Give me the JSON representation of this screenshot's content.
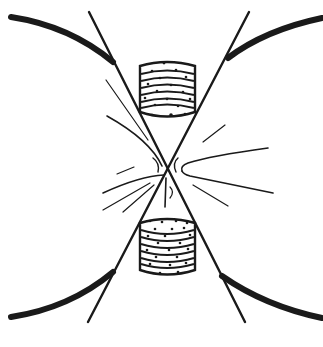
{
  "diagram": {
    "colors": {
      "background": "#ffffff",
      "ink": "#1a1a1a"
    },
    "labels": []
  }
}
